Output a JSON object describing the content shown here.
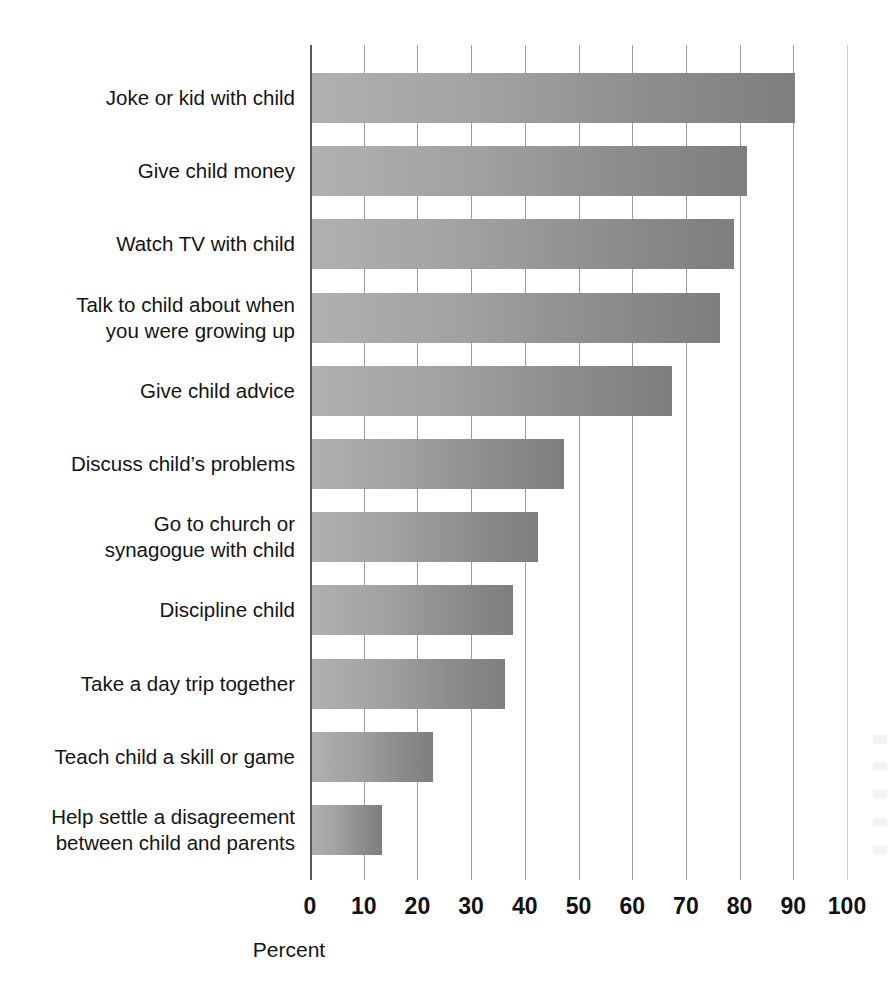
{
  "chart_data": {
    "type": "bar",
    "orientation": "horizontal",
    "title": "",
    "xlabel": "Percent",
    "ylabel": "",
    "xlim": [
      0,
      100
    ],
    "xticks": [
      0,
      10,
      20,
      30,
      40,
      50,
      60,
      70,
      80,
      90,
      100
    ],
    "grid": true,
    "legend": false,
    "bar_color": "#a0a0a0",
    "categories": [
      "Joke or kid with child",
      "Give child money",
      "Watch TV with child",
      "Talk to child about when\nyou were growing up",
      "Give child advice",
      "Discuss child’s problems",
      "Go to church or\nsynagogue with child",
      "Discipline child",
      "Take a day trip together",
      "Teach child a skill or game",
      "Help settle a disagreement\nbetween child and parents"
    ],
    "values": [
      90,
      81,
      78.5,
      76,
      67,
      47,
      42,
      37.5,
      36,
      22.5,
      13
    ]
  },
  "axis": {
    "tick_labels": [
      "0",
      "10",
      "20",
      "30",
      "40",
      "50",
      "60",
      "70",
      "80",
      "90",
      "100"
    ],
    "title": "Percent"
  }
}
